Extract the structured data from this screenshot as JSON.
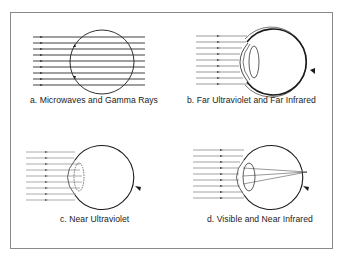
{
  "figure": {
    "panels": [
      {
        "id": "a",
        "label": "a. Microwaves and Gamma Rays",
        "description": "Rays pass straight through the eye unabsorbed"
      },
      {
        "id": "b",
        "label": "b. Far Ultraviolet and Far Infrared",
        "description": "Rays absorbed at the cornea"
      },
      {
        "id": "c",
        "label": "c. Near Ultraviolet",
        "description": "Rays absorbed in the lens"
      },
      {
        "id": "d",
        "label": "d. Visible and Near Infrared",
        "description": "Rays focused onto the retina"
      }
    ],
    "colors": {
      "stroke": "#1a1a1a",
      "ray": "#555555",
      "border": "#8a8a8a",
      "background": "#ffffff"
    }
  }
}
